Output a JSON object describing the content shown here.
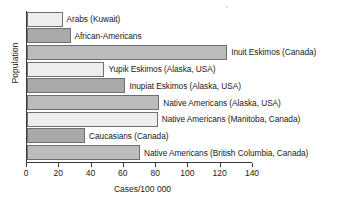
{
  "chart_data": {
    "type": "bar",
    "orientation": "horizontal",
    "title": "",
    "xlabel": "Cases/100 000",
    "ylabel": "Population",
    "xlim": [
      0,
      140
    ],
    "xticks": [
      0,
      20,
      40,
      60,
      80,
      100,
      120,
      140
    ],
    "grid": false,
    "legend": "none",
    "categories": [
      "Arabs (Kuwait)",
      "African-Americans",
      "Inuit Eskimos (Canada)",
      "Yupik Eskimos (Alaska, USA)",
      "Inupiat Eskimos (Alaska, USA)",
      "Native Americans (Alaska, USA)",
      "Native Americans (Manitoba, Canada)",
      "Caucasians (Canada)",
      "Native Americans (British Columbia, Canada)"
    ],
    "values": [
      22,
      27,
      124,
      48,
      61,
      82,
      81,
      36,
      70
    ],
    "bar_styles": [
      "light",
      "dark",
      "mid",
      "light",
      "dark",
      "mid",
      "light",
      "dark",
      "mid"
    ]
  },
  "colors": {
    "light": "#ededed",
    "dark": "#a9a9a9",
    "mid": "#bcbcbc",
    "bar_border": "#6f6f6f",
    "axis": "#3a3a3a",
    "text": "#1a1a1a",
    "background": "#ffffff"
  }
}
